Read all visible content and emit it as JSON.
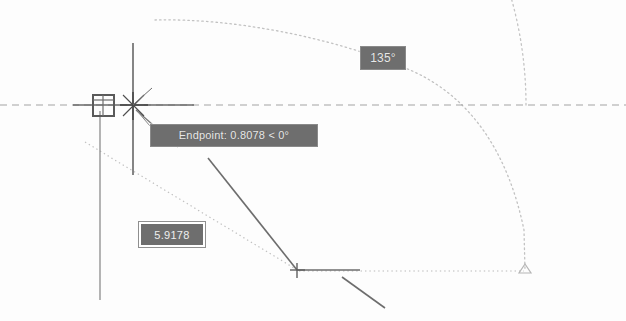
{
  "canvas": {
    "width": 626,
    "height": 321,
    "background_color": "#fdfdfd",
    "app_context": "CAD drawing area with dynamic input"
  },
  "colors": {
    "tooltip_background": "#6e6e6e",
    "tooltip_text": "#e8e8e8",
    "field_border": "#ffffff",
    "geometry_line": "#5a5a5a",
    "tracking_line": "#a9a9a9",
    "arc_line": "#bdbdbd",
    "crosshair": "#4a4a4a"
  },
  "tooltips": {
    "endpoint": {
      "label": "Endpoint: 0.8078 < 0°",
      "osnap_type": "Endpoint",
      "distance": "0.8078",
      "angle": "0°"
    },
    "angle_label": {
      "label": "135°",
      "value": "135"
    }
  },
  "input_field": {
    "name": "length-input",
    "value": "5.9178",
    "placeholder": "5.9178",
    "state": "selected"
  },
  "markers": {
    "osnap_marker": {
      "name": "endpoint-osnap-square",
      "x": 103,
      "y": 105
    },
    "crosshair": {
      "name": "crosshair-cursor",
      "x": 133,
      "y": 105
    },
    "vertex_marker": {
      "name": "vertex-plus-marker",
      "x": 297,
      "y": 270
    },
    "arc_end_marker": {
      "name": "arc-endpoint-triangle",
      "x": 525,
      "y": 272
    }
  },
  "geometry": {
    "horizontal_tracking_line": {
      "y": 105,
      "x1": 0,
      "x2": 626
    },
    "solid_horizontal_segment": {
      "y": 105,
      "x1": 73,
      "x2": 194
    },
    "vertical_crosshair_line": {
      "x": 133,
      "y1": 43,
      "y2": 175
    },
    "vertical_long_line": {
      "x": 100,
      "y1": 111,
      "y2": 300
    },
    "rubber_band_line": {
      "x1": 133,
      "y1": 105,
      "x2": 378,
      "y2": 321
    },
    "polyline_segment": {
      "x1": 297,
      "y1": 270,
      "x2": 360,
      "y2": 270
    },
    "arc": {
      "center_x": 133,
      "center_y": 105,
      "radius": 393,
      "start_angle_deg": 0,
      "end_angle_deg": 135
    },
    "dotted_diagonal": {
      "x1": 85,
      "y1": 142,
      "x2": 300,
      "y2": 271
    },
    "bottom_dotted_line": {
      "y": 271,
      "x1": 300,
      "x2": 525
    }
  }
}
